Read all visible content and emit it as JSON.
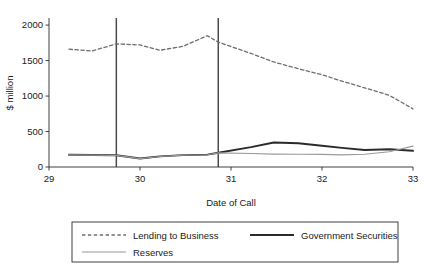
{
  "chart_data": {
    "type": "line",
    "title": "",
    "xlabel": "Date of Call",
    "ylabel": "$ million",
    "xlim": [
      29,
      33
    ],
    "ylim": [
      0,
      2100
    ],
    "xticks": [
      29,
      30,
      31,
      32,
      33
    ],
    "xtick_labels": [
      "29",
      "30",
      "31",
      "32",
      "33"
    ],
    "yticks": [
      0,
      500,
      1000,
      1500,
      2000
    ],
    "ytick_labels": [
      "0",
      "500",
      "1000",
      "1500",
      "2000"
    ],
    "grid": false,
    "legend_position": "below",
    "reference_lines": [
      {
        "name": "vertical-reference-line-1",
        "x": 29.74,
        "y_top": 2100,
        "color": "#4a4a4a"
      },
      {
        "name": "vertical-reference-line-2",
        "x": 30.86,
        "y_top": 2100,
        "color": "#4a4a4a"
      }
    ],
    "series": [
      {
        "name": "Lending to Business",
        "style": "dashed",
        "color": "#6e6e6e",
        "width": 1.3,
        "x": [
          29.22,
          29.47,
          29.74,
          30.0,
          30.22,
          30.47,
          30.74,
          30.86,
          31.22,
          31.47,
          31.74,
          32.0,
          32.22,
          32.47,
          32.74,
          33.0
        ],
        "y": [
          1660,
          1635,
          1735,
          1720,
          1645,
          1700,
          1850,
          1760,
          1600,
          1480,
          1385,
          1300,
          1210,
          1115,
          1010,
          820
        ]
      },
      {
        "name": "Government Securities",
        "style": "solid",
        "color": "#2b2b2b",
        "width": 1.9,
        "x": [
          29.22,
          29.47,
          29.74,
          30.0,
          30.22,
          30.47,
          30.74,
          30.86,
          31.22,
          31.47,
          31.74,
          32.0,
          32.22,
          32.47,
          32.74,
          33.0
        ],
        "y": [
          172,
          170,
          165,
          120,
          150,
          168,
          175,
          200,
          280,
          345,
          335,
          300,
          270,
          240,
          250,
          228
        ]
      },
      {
        "name": "Reserves",
        "style": "solid",
        "color": "#9a9a9a",
        "width": 1.2,
        "x": [
          29.22,
          29.47,
          29.74,
          30.0,
          30.22,
          30.47,
          30.74,
          30.86,
          31.22,
          31.47,
          31.74,
          32.0,
          32.22,
          32.47,
          32.74,
          33.0
        ],
        "y": [
          170,
          168,
          163,
          118,
          148,
          166,
          173,
          198,
          190,
          182,
          180,
          178,
          172,
          180,
          215,
          295
        ]
      }
    ],
    "legend_entries": [
      {
        "label": "Lending to Business",
        "style": "dashed",
        "color": "#6e6e6e",
        "width": 1.3
      },
      {
        "label": "Government Securities",
        "style": "solid",
        "color": "#2b2b2b",
        "width": 1.9
      },
      {
        "label": "Reserves",
        "style": "solid",
        "color": "#9a9a9a",
        "width": 1.2
      }
    ]
  },
  "figure": {
    "plot": {
      "left": 49,
      "right": 413,
      "top": 18,
      "bottom": 167
    },
    "legend_box": {
      "left": 72,
      "right": 398,
      "top": 222,
      "bottom": 262
    }
  }
}
